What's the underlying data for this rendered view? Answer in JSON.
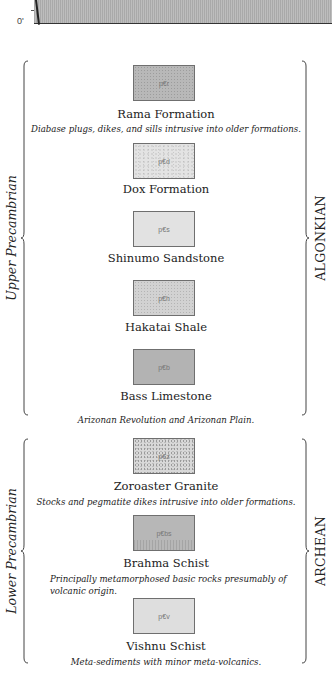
{
  "top_chart": {
    "baseline_label": "0'"
  },
  "eras": [
    {
      "left_label": "Upper Precambrian",
      "right_label": "ALGONKIAN"
    },
    {
      "left_label": "Lower Precambrian",
      "right_label": "ARCHEAN"
    }
  ],
  "formations": [
    {
      "symbol": "p€r",
      "name": "Rama Formation",
      "description": "Diabase plugs, dikes, and sills intrusive into older formations.",
      "fill": "#b8b8b8"
    },
    {
      "symbol": "p€d",
      "name": "Dox Formation",
      "description": "",
      "fill": "#e3e3e3"
    },
    {
      "symbol": "p€s",
      "name": "Shinumo Sandstone",
      "description": "",
      "fill": "#e2e2e2"
    },
    {
      "symbol": "p€h",
      "name": "Hakatai Shale",
      "description": "",
      "fill": "#d2d2d2"
    },
    {
      "symbol": "p€b",
      "name": "Bass Limestone",
      "description": "",
      "fill": "#b3b3b3"
    },
    {
      "symbol": "p€z",
      "name": "Zoroaster Granite",
      "description": "Stocks and pegmatite dikes intrusive into older formations.",
      "fill": "#d8d8d8"
    },
    {
      "symbol": "p€bs",
      "name": "Brahma Schist",
      "description": "Principally metamorphosed basic rocks presumably of volcanic origin.",
      "fill": "#b7b7b7"
    },
    {
      "symbol": "p€v",
      "name": "Vishnu Schist",
      "description": "Meta-sediments with minor meta-volcanics.",
      "fill": "#dedede"
    }
  ],
  "unconformity_note": "Arizonan Revolution and Arizonan Plain."
}
